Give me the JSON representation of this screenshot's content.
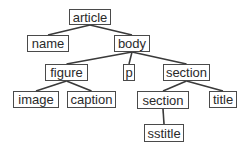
{
  "diagram": {
    "type": "tree",
    "colors": {
      "line": "#3a3a3a",
      "border": "#4a4a4a",
      "text": "#2a2a2a",
      "background": "#ffffff"
    },
    "nodes": [
      {
        "id": "article",
        "label": "article",
        "x": 69,
        "y": 9,
        "w": 42,
        "h": 16
      },
      {
        "id": "name",
        "label": "name",
        "x": 27,
        "y": 35,
        "w": 42,
        "h": 17
      },
      {
        "id": "body",
        "label": "body",
        "x": 114,
        "y": 35,
        "w": 36,
        "h": 17
      },
      {
        "id": "figure",
        "label": "figure",
        "x": 45,
        "y": 64,
        "w": 43,
        "h": 17
      },
      {
        "id": "p",
        "label": "p",
        "x": 123,
        "y": 64,
        "w": 12,
        "h": 17
      },
      {
        "id": "section1",
        "label": "section",
        "x": 163,
        "y": 64,
        "w": 47,
        "h": 17
      },
      {
        "id": "image",
        "label": "image",
        "x": 13,
        "y": 91,
        "w": 46,
        "h": 17
      },
      {
        "id": "caption",
        "label": "caption",
        "x": 67,
        "y": 91,
        "w": 49,
        "h": 17
      },
      {
        "id": "section2",
        "label": "section",
        "x": 137,
        "y": 91,
        "w": 52,
        "h": 18
      },
      {
        "id": "title",
        "label": "title",
        "x": 209,
        "y": 91,
        "w": 28,
        "h": 17
      },
      {
        "id": "sstitle",
        "label": "sstitle",
        "x": 144,
        "y": 124,
        "w": 40,
        "h": 18
      }
    ],
    "edges": [
      {
        "from": "article",
        "to": "name"
      },
      {
        "from": "article",
        "to": "body"
      },
      {
        "from": "body",
        "to": "figure"
      },
      {
        "from": "body",
        "to": "p"
      },
      {
        "from": "body",
        "to": "section1"
      },
      {
        "from": "figure",
        "to": "image"
      },
      {
        "from": "figure",
        "to": "caption"
      },
      {
        "from": "section1",
        "to": "section2"
      },
      {
        "from": "section1",
        "to": "title"
      },
      {
        "from": "section2",
        "to": "sstitle"
      }
    ]
  }
}
